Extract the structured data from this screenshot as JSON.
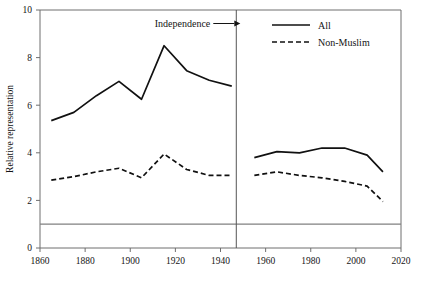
{
  "chart_data": {
    "type": "line",
    "title": "",
    "xlabel": "",
    "ylabel": "Relative representation",
    "xlim": [
      1860,
      2020
    ],
    "ylim": [
      0,
      10
    ],
    "xticks": [
      1860,
      1880,
      1900,
      1920,
      1940,
      1960,
      1980,
      2000,
      2020
    ],
    "yticks": [
      0,
      2,
      4,
      6,
      8,
      10
    ],
    "grid": false,
    "legend_position": "top-right",
    "reference_line": {
      "label": "",
      "y": 1.0,
      "color": "#808080"
    },
    "annotations": [
      {
        "name": "independence",
        "text": "Independence",
        "x": 1947,
        "arrow": "right"
      }
    ],
    "vertical_line": {
      "x": 1947,
      "color": "#555555"
    },
    "series": [
      {
        "name": "All",
        "style": "solid",
        "color": "#111111",
        "segments": [
          {
            "period": "pre-independence",
            "x": [
              1865,
              1875,
              1885,
              1895,
              1905,
              1915,
              1925,
              1935,
              1945
            ],
            "y": [
              5.35,
              5.7,
              6.4,
              7.0,
              6.25,
              8.5,
              7.45,
              7.05,
              6.8
            ]
          },
          {
            "period": "post-independence",
            "x": [
              1955,
              1965,
              1975,
              1985,
              1995,
              2005,
              2012
            ],
            "y": [
              3.8,
              4.05,
              4.0,
              4.2,
              4.2,
              3.9,
              3.2
            ]
          }
        ]
      },
      {
        "name": "Non-Muslim",
        "style": "dashed",
        "color": "#111111",
        "segments": [
          {
            "period": "pre-independence",
            "x": [
              1865,
              1875,
              1885,
              1895,
              1905,
              1915,
              1925,
              1935,
              1945
            ],
            "y": [
              2.85,
              3.0,
              3.2,
              3.35,
              2.95,
              3.95,
              3.3,
              3.05,
              3.05
            ]
          },
          {
            "period": "post-independence",
            "x": [
              1955,
              1965,
              1975,
              1985,
              1995,
              2005,
              2012
            ],
            "y": [
              3.05,
              3.2,
              3.05,
              2.95,
              2.8,
              2.6,
              1.95
            ]
          }
        ]
      }
    ]
  },
  "axes": {
    "y_title": "Relative representation",
    "x_tick_labels": [
      "1860",
      "1880",
      "1900",
      "1920",
      "1940",
      "1960",
      "1980",
      "2000",
      "2020"
    ],
    "y_tick_labels": [
      "0",
      "2",
      "4",
      "6",
      "8",
      "10"
    ]
  },
  "legend": {
    "items": [
      {
        "label": "All",
        "style": "solid"
      },
      {
        "label": "Non-Muslim",
        "style": "dashed"
      }
    ]
  },
  "annotation": {
    "independence_label": "Independence"
  }
}
